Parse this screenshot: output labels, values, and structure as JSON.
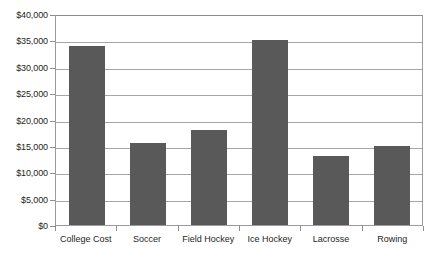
{
  "chart_data": {
    "type": "bar",
    "title": "",
    "subtitle": "",
    "xlabel": "",
    "ylabel": "",
    "categories": [
      "College Cost",
      "Soccer",
      "Field Hockey",
      "Ice Hockey",
      "Lacrosse",
      "Rowing"
    ],
    "values": [
      34000,
      15600,
      18000,
      35000,
      13000,
      15000
    ],
    "ylim": [
      0,
      40000
    ],
    "ytick_values": [
      40000,
      35000,
      30000,
      25000,
      20000,
      15000,
      10000,
      5000,
      0
    ],
    "ytick_labels": [
      "$40,000",
      "$35,000",
      "$30,000",
      "$25,000",
      "$20,000",
      "$15,000",
      "$10,000",
      "$5,000",
      "$0"
    ],
    "grid": true,
    "legend": false,
    "legend_position": "none",
    "bar_color": "#595959",
    "gridline_color": "#a6a6a6",
    "axis_color": "#8d8d8d",
    "plot_background": "#ffffff"
  }
}
